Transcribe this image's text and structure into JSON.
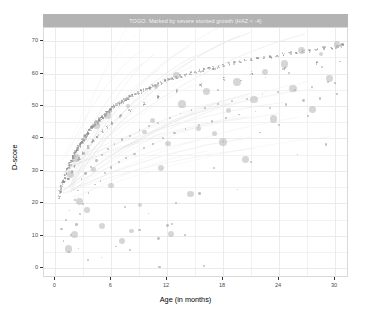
{
  "chart_data": {
    "type": "scatter",
    "title": "TOGO. Marked by severe stunted growth (HAZ < -4)",
    "xlabel": "Age (in months)",
    "ylabel": "D-score",
    "xlim": [
      -1.2,
      31.5
    ],
    "ylim": [
      -3,
      74
    ],
    "xticks": [
      0,
      6,
      12,
      18,
      24,
      30
    ],
    "yticks": [
      0,
      10,
      20,
      30,
      40,
      50,
      60,
      70
    ],
    "xtick_labels": [
      "0",
      "6",
      "12",
      "18",
      "24",
      "30"
    ],
    "ytick_labels": [
      "0",
      "10",
      "20",
      "30",
      "40",
      "50",
      "60",
      "70"
    ],
    "grid": "major-and-minor",
    "legend": "none",
    "point_color": "#a6a6a6",
    "highlight_color": "#b5b5b5",
    "strip_fill": "#b3b3b3",
    "strip_text_color": "#f2f2f2",
    "panel_background": "#ffffff",
    "grid_color": "#ebebeb",
    "series": [
      {
        "name": "population-cohort",
        "description": "dense D-score growth band, small grey points",
        "points": [
          [
            0.4,
            22.0
          ],
          [
            0.5,
            23.4
          ],
          [
            0.6,
            24.1
          ],
          [
            0.7,
            25.0
          ],
          [
            0.8,
            26.2
          ],
          [
            0.9,
            27.0
          ],
          [
            1.0,
            26.4
          ],
          [
            1.0,
            28.1
          ],
          [
            1.1,
            28.8
          ],
          [
            1.2,
            29.5
          ],
          [
            1.3,
            30.2
          ],
          [
            1.35,
            27.8
          ],
          [
            1.4,
            30.9
          ],
          [
            1.5,
            31.6
          ],
          [
            1.6,
            32.2
          ],
          [
            1.7,
            32.9
          ],
          [
            1.75,
            29.6
          ],
          [
            1.8,
            33.5
          ],
          [
            1.9,
            34.1
          ],
          [
            2.0,
            34.7
          ],
          [
            2.05,
            31.2
          ],
          [
            2.1,
            35.2
          ],
          [
            2.2,
            35.8
          ],
          [
            2.3,
            36.3
          ],
          [
            2.4,
            36.8
          ],
          [
            2.5,
            37.3
          ],
          [
            2.55,
            33.6
          ],
          [
            2.6,
            37.8
          ],
          [
            2.7,
            38.2
          ],
          [
            2.8,
            38.7
          ],
          [
            2.9,
            39.1
          ],
          [
            3.0,
            39.6
          ],
          [
            3.05,
            35.4
          ],
          [
            3.1,
            40.0
          ],
          [
            3.2,
            40.4
          ],
          [
            3.3,
            40.8
          ],
          [
            3.4,
            41.2
          ],
          [
            3.5,
            41.6
          ],
          [
            3.55,
            37.4
          ],
          [
            3.6,
            42.0
          ],
          [
            3.7,
            42.4
          ],
          [
            3.8,
            42.7
          ],
          [
            3.9,
            43.1
          ],
          [
            4.0,
            43.4
          ],
          [
            4.05,
            39.2
          ],
          [
            4.1,
            43.8
          ],
          [
            4.2,
            44.1
          ],
          [
            4.3,
            44.4
          ],
          [
            4.4,
            44.7
          ],
          [
            4.5,
            45.0
          ],
          [
            4.55,
            40.8
          ],
          [
            4.6,
            45.3
          ],
          [
            4.7,
            45.6
          ],
          [
            4.8,
            45.9
          ],
          [
            4.9,
            46.2
          ],
          [
            5.0,
            46.5
          ],
          [
            5.05,
            42.3
          ],
          [
            5.1,
            46.7
          ],
          [
            5.2,
            47.0
          ],
          [
            5.3,
            47.3
          ],
          [
            5.4,
            47.5
          ],
          [
            5.5,
            47.8
          ],
          [
            5.55,
            43.6
          ],
          [
            5.6,
            48.0
          ],
          [
            5.7,
            48.3
          ],
          [
            5.8,
            48.5
          ],
          [
            5.9,
            48.7
          ],
          [
            6.0,
            49.0
          ],
          [
            6.05,
            44.8
          ],
          [
            6.2,
            49.4
          ],
          [
            6.4,
            49.8
          ],
          [
            6.6,
            50.2
          ],
          [
            6.8,
            50.6
          ],
          [
            7.0,
            51.0
          ],
          [
            7.05,
            46.9
          ],
          [
            7.2,
            51.4
          ],
          [
            7.4,
            51.7
          ],
          [
            7.6,
            52.1
          ],
          [
            7.8,
            52.4
          ],
          [
            8.0,
            52.8
          ],
          [
            8.05,
            48.6
          ],
          [
            8.3,
            53.2
          ],
          [
            8.6,
            53.7
          ],
          [
            8.9,
            54.1
          ],
          [
            9.2,
            54.5
          ],
          [
            9.5,
            54.9
          ],
          [
            9.55,
            50.7
          ],
          [
            9.8,
            55.3
          ],
          [
            10.1,
            55.7
          ],
          [
            10.4,
            56.1
          ],
          [
            10.7,
            56.4
          ],
          [
            11.0,
            56.8
          ],
          [
            11.05,
            52.6
          ],
          [
            11.4,
            57.2
          ],
          [
            11.8,
            57.6
          ],
          [
            12.2,
            58.0
          ],
          [
            12.6,
            58.4
          ],
          [
            13.0,
            58.8
          ],
          [
            13.05,
            54.6
          ],
          [
            13.5,
            59.2
          ],
          [
            14.0,
            59.6
          ],
          [
            14.5,
            60.0
          ],
          [
            15.0,
            60.4
          ],
          [
            15.5,
            60.8
          ],
          [
            15.55,
            56.6
          ],
          [
            16.0,
            61.1
          ],
          [
            16.5,
            61.5
          ],
          [
            17.0,
            61.8
          ],
          [
            17.5,
            62.2
          ],
          [
            18.0,
            62.5
          ],
          [
            18.05,
            58.3
          ],
          [
            18.6,
            62.9
          ],
          [
            19.2,
            63.2
          ],
          [
            19.8,
            63.6
          ],
          [
            20.4,
            63.9
          ],
          [
            21.0,
            64.2
          ],
          [
            21.05,
            60.0
          ],
          [
            21.7,
            64.6
          ],
          [
            22.4,
            64.9
          ],
          [
            23.1,
            65.2
          ],
          [
            23.8,
            65.5
          ],
          [
            24.5,
            65.9
          ],
          [
            24.55,
            61.7
          ],
          [
            25.2,
            66.2
          ],
          [
            25.9,
            66.5
          ],
          [
            26.6,
            66.8
          ],
          [
            27.3,
            67.1
          ],
          [
            28.0,
            67.4
          ],
          [
            28.05,
            63.2
          ],
          [
            28.8,
            67.7
          ],
          [
            29.6,
            68.0
          ],
          [
            30.2,
            68.3
          ],
          [
            30.6,
            68.5
          ],
          [
            30.8,
            68.6
          ]
        ]
      },
      {
        "name": "scatter-cloud",
        "description": "dispersed individual observations below the band",
        "points": [
          [
            0.6,
            12.0
          ],
          [
            0.9,
            8.5
          ],
          [
            1.2,
            15.0
          ],
          [
            1.4,
            5.0
          ],
          [
            1.6,
            18.0
          ],
          [
            1.8,
            10.5
          ],
          [
            2.0,
            21.0
          ],
          [
            2.2,
            13.5
          ],
          [
            2.4,
            24.0
          ],
          [
            2.6,
            17.0
          ],
          [
            2.8,
            27.5
          ],
          [
            3.0,
            20.0
          ],
          [
            3.3,
            29.0
          ],
          [
            3.6,
            23.0
          ],
          [
            3.9,
            31.5
          ],
          [
            4.2,
            25.5
          ],
          [
            4.5,
            33.5
          ],
          [
            4.8,
            27.0
          ],
          [
            5.1,
            35.0
          ],
          [
            5.4,
            29.5
          ],
          [
            5.7,
            36.5
          ],
          [
            6.0,
            31.0
          ],
          [
            6.4,
            38.0
          ],
          [
            6.8,
            32.5
          ],
          [
            7.2,
            39.5
          ],
          [
            7.6,
            34.0
          ],
          [
            8.0,
            41.0
          ],
          [
            8.5,
            35.5
          ],
          [
            9.0,
            42.5
          ],
          [
            9.5,
            37.0
          ],
          [
            10.0,
            44.0
          ],
          [
            10.5,
            38.5
          ],
          [
            11.0,
            45.0
          ],
          [
            11.6,
            40.0
          ],
          [
            12.2,
            46.5
          ],
          [
            12.8,
            41.5
          ],
          [
            13.4,
            47.5
          ],
          [
            14.0,
            43.0
          ],
          [
            14.7,
            48.5
          ],
          [
            15.4,
            44.0
          ],
          [
            16.1,
            49.5
          ],
          [
            16.8,
            45.5
          ],
          [
            17.5,
            50.5
          ],
          [
            18.2,
            46.5
          ],
          [
            19.0,
            51.5
          ],
          [
            19.8,
            47.5
          ],
          [
            20.6,
            52.5
          ],
          [
            21.4,
            48.5
          ],
          [
            22.2,
            53.5
          ],
          [
            23.0,
            49.5
          ],
          [
            23.9,
            54.0
          ],
          [
            24.8,
            50.5
          ],
          [
            25.7,
            55.0
          ],
          [
            26.6,
            51.5
          ],
          [
            27.5,
            56.0
          ],
          [
            28.4,
            52.5
          ],
          [
            29.3,
            57.0
          ],
          [
            30.2,
            53.5
          ],
          [
            11.0,
            9.0
          ],
          [
            12.0,
            13.0
          ],
          [
            12.6,
            13.5
          ],
          [
            13.0,
            20.0
          ],
          [
            14.0,
            10.5
          ],
          [
            15.5,
            23.0
          ],
          [
            17.0,
            31.0
          ],
          [
            18.0,
            39.0
          ],
          [
            19.5,
            24.0
          ],
          [
            21.0,
            33.0
          ],
          [
            22.0,
            42.0
          ],
          [
            24.0,
            44.0
          ],
          [
            26.0,
            35.0
          ],
          [
            27.0,
            47.0
          ],
          [
            29.0,
            38.0
          ],
          [
            30.0,
            57.0
          ],
          [
            16.0,
            1.0
          ],
          [
            11.2,
            0.5
          ],
          [
            8.0,
            5.5
          ],
          [
            6.5,
            7.0
          ],
          [
            5.0,
            3.5
          ],
          [
            3.5,
            2.5
          ],
          [
            2.5,
            6.0
          ],
          [
            9.0,
            12.0
          ],
          [
            10.0,
            17.0
          ],
          [
            7.5,
            19.0
          ],
          [
            20.0,
            58.0
          ],
          [
            25.0,
            60.0
          ],
          [
            28.5,
            62.0
          ],
          [
            30.5,
            64.0
          ],
          [
            22.5,
            58.5
          ],
          [
            17.5,
            55.0
          ]
        ]
      },
      {
        "name": "highlighted-stunted-cases",
        "description": "larger grey circles: children with HAZ < -4",
        "points": [
          [
            1.4,
            6.0
          ],
          [
            2.1,
            10.5
          ],
          [
            2.6,
            20.5
          ],
          [
            3.4,
            18.0
          ],
          [
            4.1,
            30.5
          ],
          [
            5.0,
            13.0
          ],
          [
            6.0,
            25.5
          ],
          [
            7.2,
            8.5
          ],
          [
            8.2,
            11.5
          ],
          [
            9.1,
            19.5
          ],
          [
            9.6,
            42.0
          ],
          [
            10.4,
            45.5
          ],
          [
            11.3,
            31.0
          ],
          [
            12.1,
            38.5
          ],
          [
            12.4,
            10.5
          ],
          [
            13.6,
            50.5
          ],
          [
            14.5,
            23.0
          ],
          [
            15.4,
            43.0
          ],
          [
            16.2,
            54.5
          ],
          [
            17.1,
            41.5
          ],
          [
            18.0,
            39.0
          ],
          [
            18.6,
            48.5
          ],
          [
            19.5,
            57.5
          ],
          [
            20.4,
            33.5
          ],
          [
            21.3,
            52.0
          ],
          [
            22.5,
            60.5
          ],
          [
            23.4,
            46.0
          ],
          [
            24.6,
            63.0
          ],
          [
            25.5,
            55.5
          ],
          [
            26.4,
            67.0
          ],
          [
            27.6,
            49.0
          ],
          [
            28.5,
            66.0
          ],
          [
            29.4,
            58.5
          ],
          [
            30.2,
            69.0
          ],
          [
            7.8,
            50.0
          ],
          [
            5.6,
            47.0
          ],
          [
            4.4,
            44.0
          ],
          [
            3.2,
            40.0
          ],
          [
            2.3,
            34.0
          ],
          [
            1.6,
            29.0
          ],
          [
            13.0,
            59.5
          ],
          [
            10.8,
            56.0
          ]
        ]
      }
    ]
  }
}
